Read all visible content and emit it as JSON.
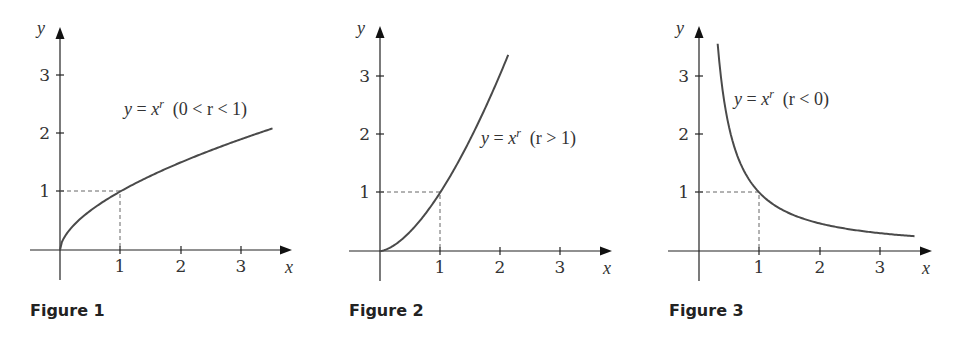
{
  "figures": [
    {
      "caption": "Figure 1",
      "label": {
        "y": "y",
        "eq": " = ",
        "x": "x",
        "sup": "r",
        "cond": "  (0 < r < 1)"
      },
      "x_axis_label": "x",
      "y_axis_label": "y",
      "x_ticks": [
        "1",
        "2",
        "3"
      ],
      "y_ticks": [
        "1",
        "2",
        "3"
      ]
    },
    {
      "caption": "Figure 2",
      "label": {
        "y": "y",
        "eq": " = ",
        "x": "x",
        "sup": "r",
        "cond": "  (r > 1)"
      },
      "x_axis_label": "x",
      "y_axis_label": "y",
      "x_ticks": [
        "1",
        "2",
        "3"
      ],
      "y_ticks": [
        "1",
        "2",
        "3"
      ]
    },
    {
      "caption": "Figure 3",
      "label": {
        "y": "y",
        "eq": " = ",
        "x": "x",
        "sup": "r",
        "cond": "  (r < 0)"
      },
      "x_axis_label": "x",
      "y_axis_label": "y",
      "x_ticks": [
        "1",
        "2",
        "3"
      ],
      "y_ticks": [
        "1",
        "2",
        "3"
      ]
    }
  ],
  "chart_data": [
    {
      "type": "line",
      "title": "Figure 1",
      "annotation": "y = x^r (0 < r < 1)",
      "xlabel": "x",
      "ylabel": "y",
      "xlim": [
        -0.5,
        3.85
      ],
      "ylim": [
        -0.5,
        3.8
      ],
      "x_ticks": [
        1,
        2,
        3
      ],
      "y_ticks": [
        1,
        2,
        3
      ],
      "grid": false,
      "series": [
        {
          "name": "y = x^r, r≈0.58",
          "r": 0.58,
          "x": [
            0,
            0.25,
            0.5,
            1,
            1.5,
            2,
            2.5,
            3,
            3.53
          ],
          "values": [
            0,
            0.45,
            0.67,
            1,
            1.27,
            1.49,
            1.7,
            1.89,
            2.08
          ]
        }
      ],
      "reference_point": [
        1,
        1
      ]
    },
    {
      "type": "line",
      "title": "Figure 2",
      "annotation": "y = x^r (r > 1)",
      "xlabel": "x",
      "ylabel": "y",
      "xlim": [
        -0.5,
        3.85
      ],
      "ylim": [
        -0.5,
        3.8
      ],
      "x_ticks": [
        1,
        2,
        3
      ],
      "y_ticks": [
        1,
        2,
        3
      ],
      "grid": false,
      "series": [
        {
          "name": "y = x^r, r≈1.6",
          "r": 1.6,
          "x": [
            0,
            0.25,
            0.5,
            1,
            1.5,
            2,
            2.13
          ],
          "values": [
            0,
            0.11,
            0.33,
            1,
            1.91,
            3.03,
            3.36
          ]
        }
      ],
      "reference_point": [
        1,
        1
      ]
    },
    {
      "type": "line",
      "title": "Figure 3",
      "annotation": "y = x^r (r < 0)",
      "xlabel": "x",
      "ylabel": "y",
      "xlim": [
        -0.5,
        3.85
      ],
      "ylim": [
        -0.5,
        3.8
      ],
      "x_ticks": [
        1,
        2,
        3
      ],
      "y_ticks": [
        1,
        2,
        3
      ],
      "grid": false,
      "series": [
        {
          "name": "y = x^r, r≈-1.08",
          "r": -1.08,
          "x": [
            0.31,
            0.5,
            1,
            1.5,
            2,
            2.5,
            3,
            3.58
          ],
          "values": [
            3.54,
            2.11,
            1,
            0.65,
            0.47,
            0.37,
            0.31,
            0.25
          ]
        }
      ],
      "reference_point": [
        1,
        1
      ]
    }
  ]
}
